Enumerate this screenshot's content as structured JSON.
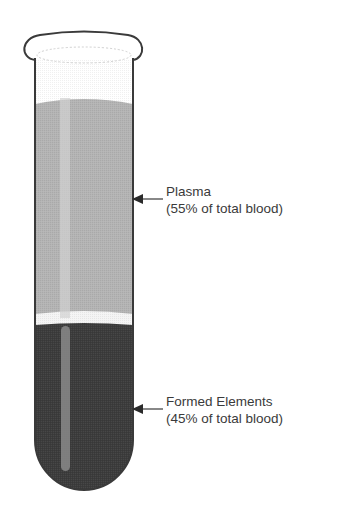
{
  "diagram": {
    "layers": [
      {
        "name": "plasma",
        "title": "Plasma",
        "detail": "(55% of total blood)",
        "color": "#b4b4b4"
      },
      {
        "name": "buffy-coat",
        "color": "#f4f4f4"
      },
      {
        "name": "formed-elements",
        "title": "Formed Elements",
        "detail": "(45% of total blood)",
        "color": "#3c3c3c"
      }
    ],
    "colors": {
      "outline": "#3a3a3a",
      "text": "#3a3a3a",
      "background": "#ffffff",
      "highlight": "#d8d8d8"
    }
  }
}
